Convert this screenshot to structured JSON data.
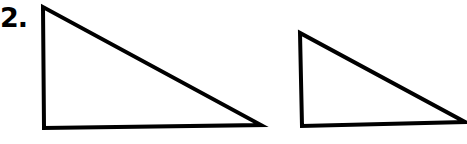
{
  "problem": {
    "number_label": "2."
  },
  "figures": [
    {
      "name": "triangle-large",
      "points": [
        [
          43,
          7
        ],
        [
          44,
          128
        ],
        [
          261,
          125
        ]
      ]
    },
    {
      "name": "triangle-small",
      "points": [
        [
          300,
          33
        ],
        [
          302,
          126
        ],
        [
          465,
          122
        ]
      ]
    }
  ],
  "colors": {
    "stroke": "#000000",
    "fill": "#ffffff"
  }
}
